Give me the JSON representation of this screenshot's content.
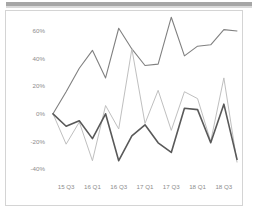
{
  "card": {
    "title": "",
    "top_band_color": "#a6a6a6",
    "border_color": "#d4d4d4",
    "background": "#ffffff"
  },
  "chart_data": {
    "type": "line",
    "title": "",
    "subtitle": "",
    "xlabel": "",
    "ylabel": "",
    "ylim": [
      -40,
      60
    ],
    "ytick_labels": [
      "60%",
      "40%",
      "20%",
      "0%",
      "-20%",
      "-40%"
    ],
    "ytick_values": [
      60,
      40,
      20,
      0,
      -20,
      -40
    ],
    "grid": false,
    "legend": "none",
    "legend_entries": [],
    "x": [
      "15 Q2",
      "15 Q3",
      "15 Q4",
      "16 Q1",
      "16 Q2",
      "16 Q3",
      "16 Q4",
      "17 Q1",
      "17 Q2",
      "17 Q3",
      "17 Q4",
      "18 Q1",
      "18 Q2",
      "18 Q3",
      "18 Q4"
    ],
    "xtick_labels": [
      "15 Q3",
      "16 Q1",
      "16 Q3",
      "17 Q1",
      "17 Q3",
      "18 Q1",
      "18 Q3"
    ],
    "xtick_indices": [
      1,
      3,
      5,
      7,
      9,
      11,
      13
    ],
    "series": [
      {
        "name": "series-1",
        "color": "#808080",
        "width": 1.1,
        "values": [
          0,
          16,
          33,
          46,
          26,
          62,
          47,
          35,
          36,
          70,
          42,
          49,
          50,
          61,
          60
        ]
      },
      {
        "name": "series-2",
        "color": "#bfbfbf",
        "width": 1.0,
        "values": [
          0,
          -22,
          -6,
          -34,
          6,
          -11,
          47,
          -7,
          17,
          -12,
          16,
          11,
          -20,
          26,
          -35
        ]
      },
      {
        "name": "series-3",
        "color": "#595959",
        "width": 1.6,
        "values": [
          0,
          -9,
          -5,
          -18,
          0,
          -34,
          -16,
          -8,
          -21,
          -28,
          4,
          3,
          -21,
          7,
          -33
        ]
      }
    ]
  }
}
